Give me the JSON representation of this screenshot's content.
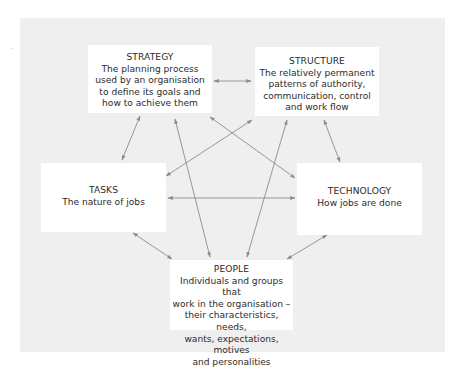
{
  "diagram": {
    "style": {
      "panel_color": "#efefef",
      "box_color": "#ffffff",
      "arrow_color": "#8c8c8c",
      "text_color": "#2b2b2b"
    },
    "nodes": [
      {
        "id": "strategy",
        "title": "STRATEGY",
        "description": "The planning process\nused by an organisation\nto define its goals and\nhow to achieve them"
      },
      {
        "id": "structure",
        "title": "STRUCTURE",
        "description": "The relatively permanent\npatterns of authority,\ncommunication, control\nand work flow"
      },
      {
        "id": "tasks",
        "title": "TASKS",
        "description": "The nature of jobs"
      },
      {
        "id": "technology",
        "title": "TECHNOLOGY",
        "description": "How jobs are done"
      },
      {
        "id": "people",
        "title": "PEOPLE",
        "description": "Individuals and groups that\nwork in the organisation –\ntheir characteristics, needs,\nwants, expectations, motives\nand personalities"
      }
    ],
    "edges": [
      {
        "from": "strategy",
        "to": "structure",
        "direction": "both"
      },
      {
        "from": "strategy",
        "to": "tasks",
        "direction": "both"
      },
      {
        "from": "strategy",
        "to": "people",
        "direction": "both"
      },
      {
        "from": "strategy",
        "to": "technology",
        "direction": "both"
      },
      {
        "from": "structure",
        "to": "tasks",
        "direction": "both"
      },
      {
        "from": "structure",
        "to": "people",
        "direction": "both"
      },
      {
        "from": "structure",
        "to": "technology",
        "direction": "both"
      },
      {
        "from": "tasks",
        "to": "technology",
        "direction": "both"
      },
      {
        "from": "tasks",
        "to": "people",
        "direction": "both"
      },
      {
        "from": "technology",
        "to": "people",
        "direction": "both"
      }
    ]
  }
}
